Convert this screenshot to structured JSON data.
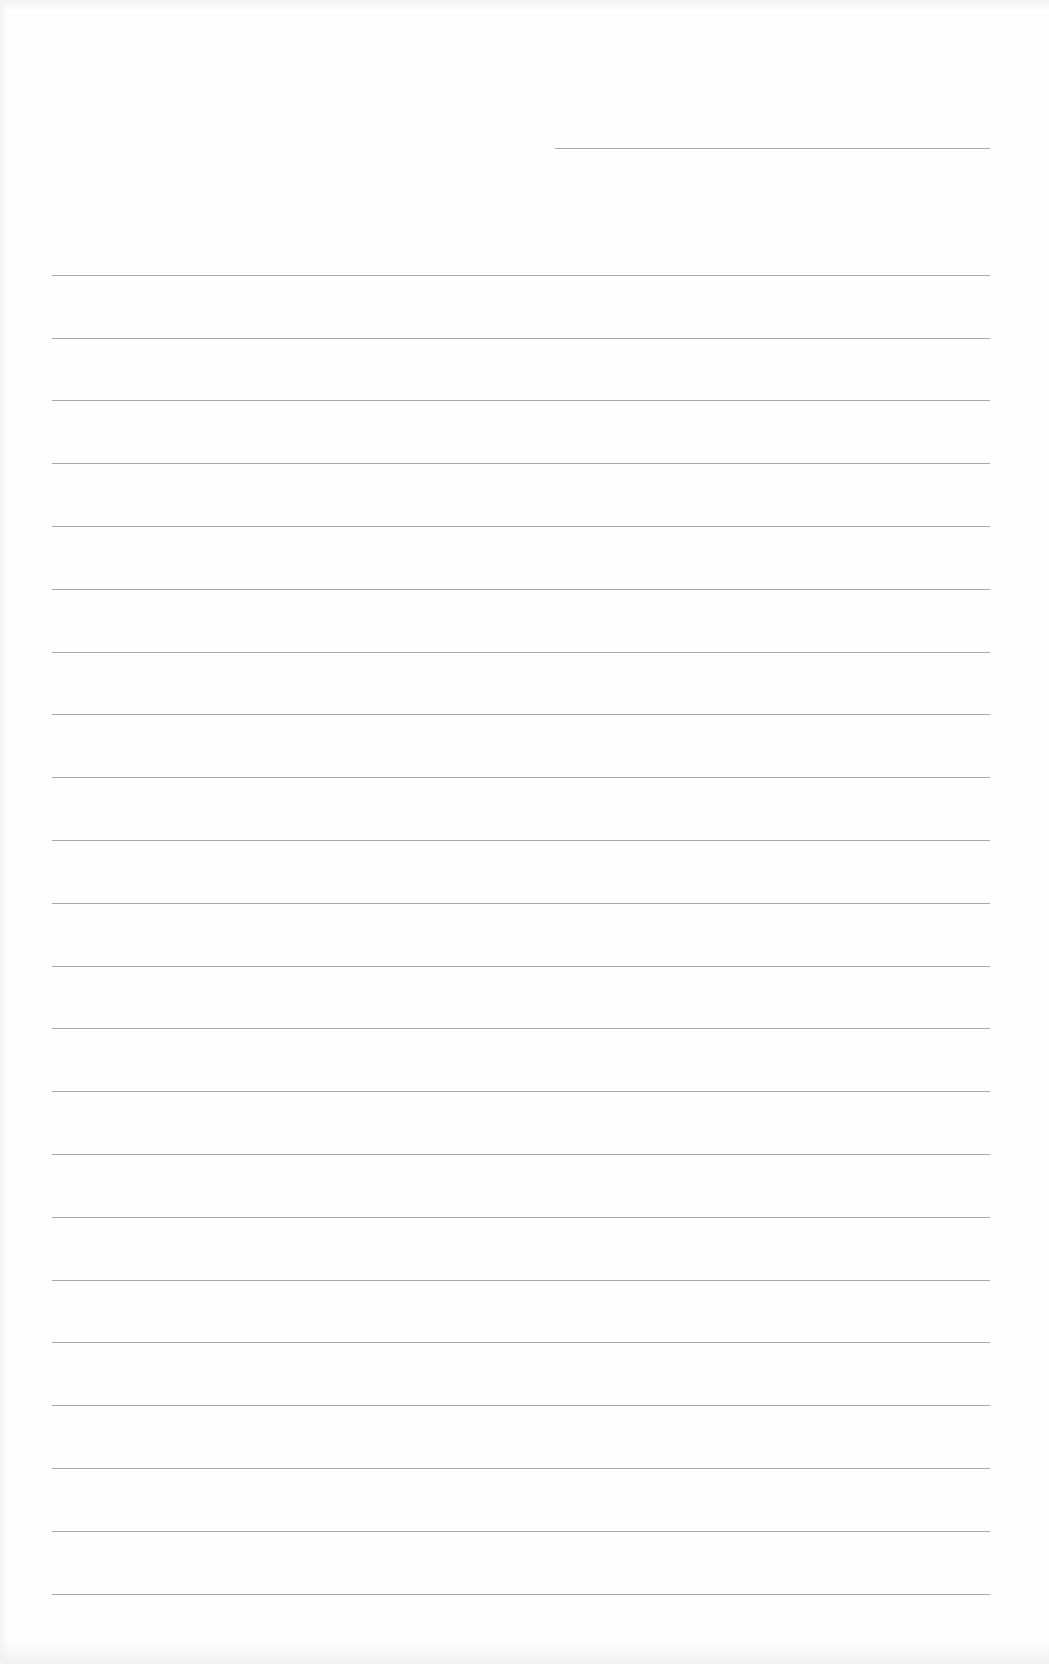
{
  "page": {
    "type": "lined-paper",
    "background": "#fefefe",
    "rule_color": "#9a9a9a",
    "header_line": {
      "y": 148,
      "x_start": 555,
      "x_end": 990
    },
    "ruled_lines": {
      "x_start": 52,
      "x_end": 990,
      "y_positions": [
        275,
        338,
        400,
        463,
        526,
        589,
        652,
        714,
        777,
        840,
        903,
        966,
        1028,
        1091,
        1154,
        1217,
        1280,
        1342,
        1405,
        1468,
        1531,
        1594
      ]
    },
    "text": ""
  }
}
